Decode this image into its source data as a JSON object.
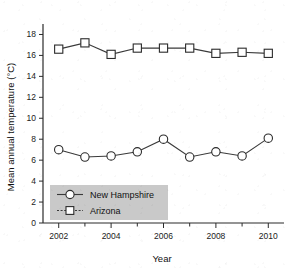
{
  "chart_data": {
    "type": "line",
    "title": "",
    "xlabel": "Year",
    "ylabel": "Mean annual temperature (°C)",
    "x": [
      2002,
      2003,
      2004,
      2005,
      2006,
      2007,
      2008,
      2009,
      2010
    ],
    "xlim": [
      2001.4,
      2010.6
    ],
    "ylim": [
      0,
      19
    ],
    "xticks": [
      2002,
      2003,
      2004,
      2005,
      2006,
      2007,
      2008,
      2009,
      2010
    ],
    "xticklabels": [
      "2002",
      "",
      "2004",
      "",
      "2006",
      "",
      "2008",
      "",
      "2010"
    ],
    "yticks": [
      0,
      2,
      4,
      6,
      8,
      10,
      12,
      14,
      16,
      18
    ],
    "yticklabels": [
      "0",
      "2",
      "4",
      "6",
      "8",
      "10",
      "12",
      "14",
      "16",
      "18"
    ],
    "grid": false,
    "legend_position": "lower-left-inside",
    "series": [
      {
        "name": "New Hampshire",
        "marker": "circle",
        "linestyle": "solid",
        "values": [
          7.0,
          6.3,
          6.4,
          6.8,
          8.0,
          6.3,
          6.8,
          6.4,
          8.1
        ]
      },
      {
        "name": "Arizona",
        "marker": "square",
        "linestyle": "solid",
        "values": [
          16.6,
          17.2,
          16.1,
          16.7,
          16.7,
          16.7,
          16.2,
          16.3,
          16.2
        ]
      }
    ],
    "legend": [
      {
        "label": "New Hampshire",
        "marker": "circle",
        "linestyle": "solid"
      },
      {
        "label": "Arizona",
        "marker": "square",
        "linestyle": "dotted"
      }
    ],
    "colors": {
      "line": "#3a3a3a",
      "marker_face": "#ffffff",
      "marker_edge": "#2b2b2b",
      "axis": "#2b2b2b",
      "legend_background": "#c9c9c9",
      "page_background": "#ffffff"
    }
  }
}
